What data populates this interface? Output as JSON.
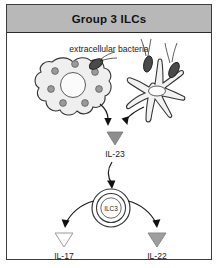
{
  "panel": {
    "width": 219,
    "height": 268,
    "background": "#ffffff",
    "border_color": "#3d3d3d"
  },
  "header": {
    "title": "Group 3 ILCs",
    "background": "#b8b8b8",
    "text_color": "#121212"
  },
  "diagram": {
    "type": "biology-pathway",
    "top_label": "extracellular bacteria",
    "cells": [
      {
        "id": "macrophage",
        "name": "macrophage-cell",
        "fill": "#efefef",
        "stroke": "#333333",
        "granule_fill": "#9a9a9a",
        "nucleus_fill": "#fbfbfb"
      },
      {
        "id": "dendritic",
        "name": "dendritic-cell",
        "fill": "#f2f2f2",
        "stroke": "#333333",
        "nucleus_fill": "#fbfbfb"
      },
      {
        "id": "ilc3",
        "name": "ilc3-cell",
        "label": "ILC3",
        "fill": "#ffffff",
        "stroke": "#3a3a3a"
      }
    ],
    "bacteria": {
      "name": "bacterium",
      "fill": "#4a4a4a",
      "stroke": "#1c1c1c",
      "count": 3
    },
    "cytokines": [
      {
        "id": "il23",
        "label": "IL-23",
        "marker": "triangle",
        "fill": "#8e8e8e",
        "stroke": "#7a7a7a"
      },
      {
        "id": "il17",
        "label": "IL-17",
        "marker": "triangle",
        "fill": "#fdfdfd",
        "stroke": "#9d9d9d"
      },
      {
        "id": "il22",
        "label": "IL-22",
        "marker": "triangle",
        "fill": "#9e9e9e",
        "stroke": "#8a8a8a"
      }
    ],
    "arrows": [
      {
        "id": "macrophage-to-il23",
        "from": "macrophage",
        "to": "il23",
        "color": "#1a1a1a"
      },
      {
        "id": "dendritic-to-il23",
        "from": "dendritic",
        "to": "il23",
        "color": "#1a1a1a"
      },
      {
        "id": "il23-to-ilc3",
        "from": "il23",
        "to": "ilc3",
        "color": "#1a1a1a"
      },
      {
        "id": "ilc3-to-il17",
        "from": "ilc3",
        "to": "il17",
        "color": "#1a1a1a"
      },
      {
        "id": "ilc3-to-il22",
        "from": "ilc3",
        "to": "il22",
        "color": "#1a1a1a"
      }
    ]
  }
}
